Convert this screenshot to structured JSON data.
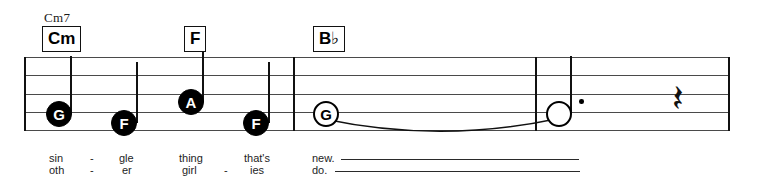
{
  "score": {
    "staff": {
      "left": 24,
      "right": 729,
      "top": 57,
      "bottom": 130,
      "line_count": 5,
      "line_color": "#4a4a4a"
    },
    "barlines": [
      {
        "name": "barline-start",
        "x": 24,
        "type": "single"
      },
      {
        "name": "barline-1",
        "x": 293,
        "type": "single"
      },
      {
        "name": "barline-2",
        "x": 535,
        "type": "single"
      },
      {
        "name": "barline-end",
        "x": 728,
        "type": "single"
      }
    ],
    "chords": [
      {
        "name": "chord-cm7",
        "label": "Cm7",
        "boxed": false,
        "x": 44,
        "y": 10
      },
      {
        "name": "chord-cm",
        "label": "Cm",
        "boxed": true,
        "x": 42,
        "y": 26
      },
      {
        "name": "chord-f",
        "label": "F",
        "boxed": true,
        "x": 184,
        "y": 26
      },
      {
        "name": "chord-bb",
        "label": "B",
        "accidental": "♭",
        "boxed": true,
        "x": 313,
        "y": 26
      }
    ],
    "notes": [
      {
        "name": "note-g1",
        "letter": "G",
        "head": "filled",
        "x": 46,
        "y": 101,
        "stem": "up",
        "stem_x": 70,
        "stem_top": 56,
        "stem_bottom": 114,
        "dotted": false
      },
      {
        "name": "note-f1",
        "letter": "F",
        "head": "filled",
        "x": 111,
        "y": 110,
        "stem": "up",
        "stem_x": 136,
        "stem_top": 62,
        "stem_bottom": 123,
        "dotted": false
      },
      {
        "name": "note-a1",
        "letter": "A",
        "head": "filled",
        "x": 178,
        "y": 89,
        "stem": "up",
        "stem_x": 202,
        "stem_top": 52,
        "stem_bottom": 102,
        "dotted": false
      },
      {
        "name": "note-f2",
        "letter": "F",
        "head": "filled",
        "x": 243,
        "y": 110,
        "stem": "up",
        "stem_x": 268,
        "stem_top": 62,
        "stem_bottom": 123,
        "dotted": false
      },
      {
        "name": "note-g2",
        "letter": "G",
        "head": "hollow",
        "x": 313,
        "y": 101,
        "stem": "none",
        "dotted": false
      },
      {
        "name": "note-tied",
        "letter": "",
        "head": "blank",
        "x": 546,
        "y": 101,
        "stem": "up",
        "stem_x": 570,
        "stem_top": 56,
        "stem_bottom": 114,
        "dotted": true,
        "dot_x": 579,
        "dot_y": 99
      }
    ],
    "ties": [
      {
        "name": "tie-g-to-held",
        "from_x": 324,
        "to_x": 556,
        "y": 118,
        "depth": 16
      }
    ],
    "rests": [
      {
        "name": "quarter-rest",
        "glyph": "𝄽",
        "x": 672,
        "y": 79
      }
    ]
  },
  "lyrics": {
    "verse1": [
      {
        "name": "lyric-1-1",
        "text": "sin",
        "x": 49,
        "y": 152
      },
      {
        "name": "lyric-1-hyphen-1",
        "text": "-",
        "x": 90,
        "y": 152
      },
      {
        "name": "lyric-1-2",
        "text": "gle",
        "x": 119,
        "y": 152
      },
      {
        "name": "lyric-1-3",
        "text": "thing",
        "x": 179,
        "y": 152
      },
      {
        "name": "lyric-1-4",
        "text": "that's",
        "x": 244,
        "y": 152
      },
      {
        "name": "lyric-1-5",
        "text": "new.",
        "x": 312,
        "y": 152
      }
    ],
    "verse2": [
      {
        "name": "lyric-2-1",
        "text": "oth",
        "x": 49,
        "y": 164
      },
      {
        "name": "lyric-2-hyphen-1",
        "text": "-",
        "x": 90,
        "y": 164
      },
      {
        "name": "lyric-2-2",
        "text": "er",
        "x": 122,
        "y": 164
      },
      {
        "name": "lyric-2-3",
        "text": "girl",
        "x": 182,
        "y": 164
      },
      {
        "name": "lyric-2-hyphen-2",
        "text": "-",
        "x": 224,
        "y": 164
      },
      {
        "name": "lyric-2-4",
        "text": "ies",
        "x": 250,
        "y": 164
      },
      {
        "name": "lyric-2-5",
        "text": "do.",
        "x": 312,
        "y": 164
      }
    ],
    "extenders": [
      {
        "name": "lyric-extender-1",
        "x": 341,
        "y": 159,
        "width": 238
      },
      {
        "name": "lyric-extender-2",
        "x": 335,
        "y": 171,
        "width": 245
      }
    ]
  }
}
